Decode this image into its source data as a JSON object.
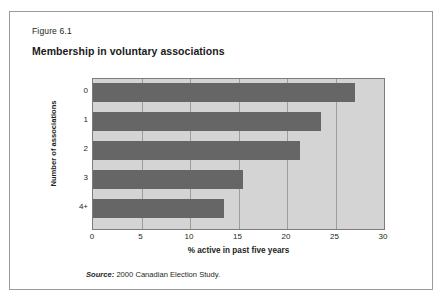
{
  "figure": {
    "number": "Figure 6.1",
    "title": "Membership in voluntary associations",
    "source_label": "Source:",
    "source_text": " 2000 Canadian Election Study."
  },
  "chart_data": {
    "type": "bar",
    "orientation": "horizontal",
    "title": "Membership in voluntary associations",
    "categories": [
      "0",
      "1",
      "2",
      "3",
      "4+"
    ],
    "values": [
      27.0,
      23.5,
      21.3,
      15.5,
      13.5
    ],
    "xlabel": "% active in past five years",
    "ylabel": "Number of associations",
    "xlim": [
      0,
      30
    ],
    "xticks": [
      "0",
      "5",
      "10",
      "15",
      "20",
      "25",
      "30"
    ],
    "xtick_values": [
      0,
      5,
      10,
      15,
      20,
      25,
      30
    ],
    "grid": true,
    "legend": false,
    "colors": {
      "bar": "#666666",
      "plot_background": "#d4d4d4",
      "gridline": "#9d9d9d",
      "axis": "#7c7c7c",
      "text": "#231f20",
      "frame": "#9a9a9a"
    }
  }
}
